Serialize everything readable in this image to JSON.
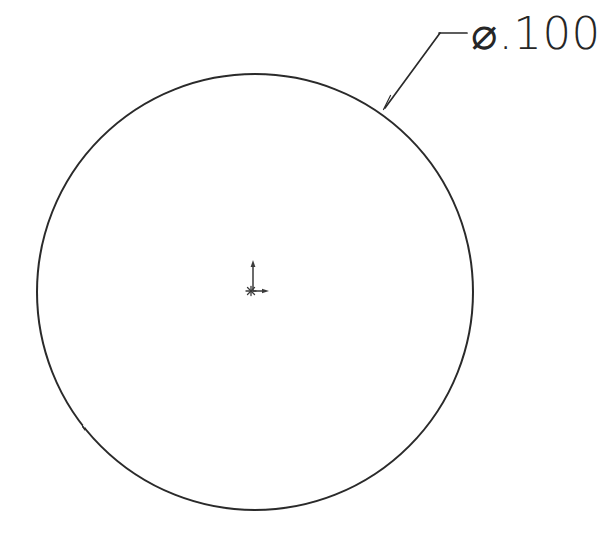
{
  "drawing": {
    "title": "Circle part detail view",
    "background_color": "#ffffff",
    "line_color": "#2a2a2a",
    "text_color": "#262626",
    "width": 602,
    "height": 539
  },
  "geometry": {
    "circle": {
      "name": "outer-circle",
      "center_x": 255,
      "center_y": 292,
      "radius": 218,
      "stroke_width": 2
    },
    "origin_marker": {
      "name": "origin-marker",
      "x": 253,
      "y": 291,
      "y_axis_length": 29,
      "x_axis_length": 15,
      "label": "origin"
    }
  },
  "annotations": {
    "diameter_callout": {
      "symbol": "⌀",
      "value": ".100",
      "full_text": "⌀.100",
      "text_x": 474,
      "text_y": 33,
      "leader": {
        "arrow_tip_x": 384,
        "arrow_tip_y": 108,
        "elbow_x": 440,
        "elbow_y": 33,
        "landing_end_x": 467,
        "landing_end_y": 33
      }
    }
  }
}
